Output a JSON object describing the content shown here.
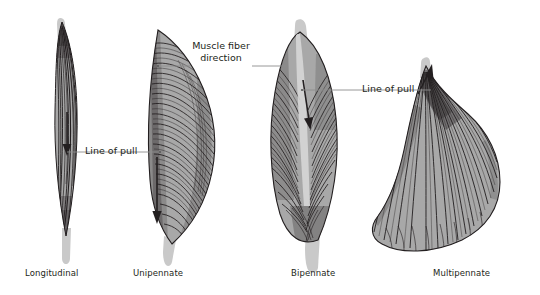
{
  "figure": {
    "background_color": "#ffffff",
    "ink_color": "#231f20",
    "muscle_fill": "#a8a8a8",
    "tendon_fill": "#c9c9c9",
    "leader_color": "#6e6e6e"
  },
  "annotations": {
    "muscle_fiber_direction": {
      "line1": "Muscle fiber",
      "line2": "direction"
    },
    "line_of_pull_left": "Line of pull",
    "line_of_pull_right": "Line of pull"
  },
  "muscles": [
    {
      "id": "longitudinal",
      "label": "Longitudinal",
      "arrow": "down",
      "description": "fusiform spindle with parallel fibers"
    },
    {
      "id": "unipennate",
      "label": "Unipennate",
      "arrow": "down",
      "description": "fibers angle from one side of a central tendon"
    },
    {
      "id": "bipennate",
      "label": "Bipennate",
      "arrow": "down",
      "description": "fibers angle from both sides of a central tendon"
    },
    {
      "id": "multipennate",
      "label": "Multipennate",
      "arrow": "up-right",
      "description": "fan shaped with several tendon converging points"
    }
  ]
}
